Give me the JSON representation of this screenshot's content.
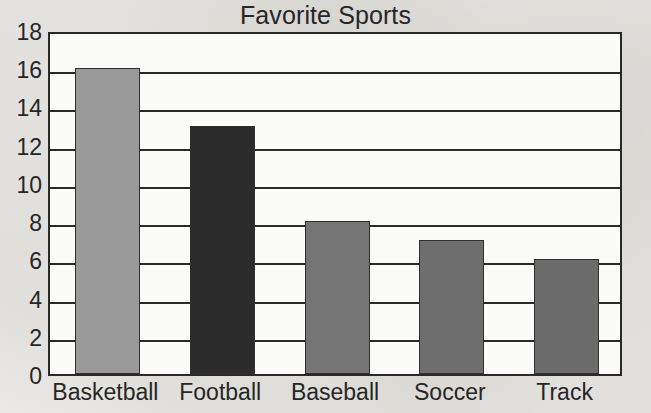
{
  "chart_data": {
    "type": "bar",
    "title": "Favorite Sports",
    "xlabel": "",
    "ylabel": "",
    "categories": [
      "Basketball",
      "Football",
      "Baseball",
      "Soccer",
      "Track"
    ],
    "values": [
      16,
      13,
      8,
      7,
      6
    ],
    "series": [
      {
        "name": "Favorite Sports",
        "values": [
          16,
          13,
          8,
          7,
          6
        ]
      }
    ],
    "ylim": [
      0,
      18
    ],
    "ytick_step": 2,
    "ytick_labels": [
      "0",
      "2",
      "4",
      "6",
      "8",
      "10",
      "12",
      "14",
      "16",
      "18"
    ],
    "ytick_values": [
      0,
      2,
      4,
      6,
      8,
      10,
      12,
      14,
      16,
      18
    ],
    "grid": "horizontal",
    "legend": "none",
    "bar_colors": [
      "#9a9a9a",
      "#2b2b2b",
      "#757575",
      "#6e6e6e",
      "#6b6b6b"
    ],
    "axis_color": "#2a2a2a",
    "plot_background": "#fbfbfa",
    "page_background": "#f2f1ee",
    "text_color": "#262626"
  }
}
